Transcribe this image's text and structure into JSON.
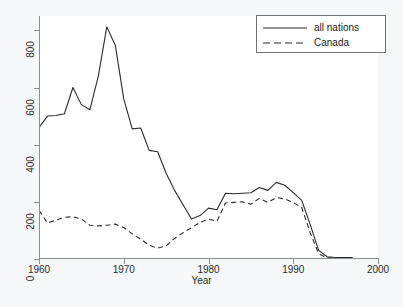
{
  "chart_data": {
    "type": "line",
    "title": "",
    "xlabel": "Year",
    "ylabel": "",
    "xlim": [
      1960,
      2000
    ],
    "ylim": [
      0,
      850
    ],
    "grid": false,
    "legend_position": "top-right",
    "xticks": [
      "1960",
      "1970",
      "1980",
      "1990",
      "2000"
    ],
    "xtick_values": [
      1960,
      1970,
      1980,
      1990,
      2000
    ],
    "yticks": [
      "0",
      "200",
      "400",
      "600",
      "800"
    ],
    "ytick_values": [
      0,
      200,
      400,
      600,
      800
    ],
    "x": [
      1960,
      1961,
      1962,
      1963,
      1964,
      1965,
      1966,
      1967,
      1968,
      1969,
      1970,
      1971,
      1972,
      1973,
      1974,
      1975,
      1976,
      1977,
      1978,
      1979,
      1980,
      1981,
      1982,
      1983,
      1984,
      1985,
      1986,
      1987,
      1988,
      1989,
      1990,
      1991,
      1992,
      1993,
      1994,
      1995,
      1996,
      1997
    ],
    "series": [
      {
        "name": "all nations",
        "style": "solid",
        "color": "#2b2b2b",
        "values": [
          460,
          500,
          502,
          508,
          600,
          540,
          522,
          640,
          812,
          748,
          560,
          455,
          458,
          380,
          375,
          300,
          240,
          190,
          140,
          152,
          178,
          172,
          230,
          228,
          230,
          232,
          250,
          240,
          268,
          258,
          232,
          205,
          120,
          30,
          8,
          5,
          5,
          5
        ]
      },
      {
        "name": "Canada",
        "style": "dashed",
        "color": "#2b2b2b",
        "values": [
          170,
          126,
          136,
          146,
          148,
          140,
          118,
          116,
          118,
          122,
          110,
          88,
          70,
          48,
          38,
          46,
          72,
          92,
          110,
          128,
          140,
          132,
          196,
          198,
          200,
          192,
          212,
          198,
          215,
          210,
          198,
          180,
          92,
          18,
          4,
          4,
          4,
          4
        ]
      }
    ]
  },
  "legend": {
    "items": [
      {
        "label": "all nations",
        "style": "solid"
      },
      {
        "label": "Canada",
        "style": "dashed"
      }
    ]
  },
  "axis": {
    "x_title": "Year"
  }
}
